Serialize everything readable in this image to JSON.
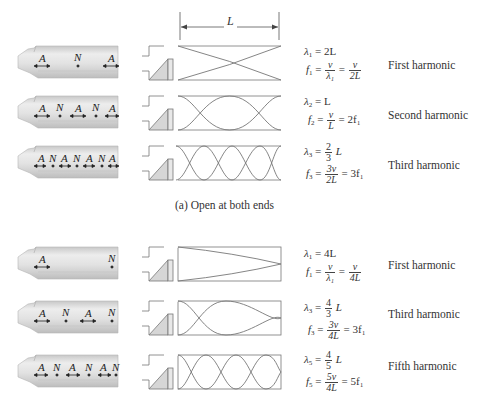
{
  "figure": {
    "length_label": "L",
    "caption_a": "(a) Open at both ends",
    "colors": {
      "line": "#7a7a7a",
      "pipe_fill": "#d9d9d9",
      "pipe_highlight": "#f2f2f2",
      "mouthpiece_fill": "#d6d6d6",
      "text": "#333333"
    }
  },
  "open_both_ends": [
    {
      "harmonic_label": "First harmonic",
      "pipe_markers": [
        "A",
        "N",
        "A"
      ],
      "wavelength": {
        "lhs": "λ",
        "sub": "1",
        "rhs": "= 2L"
      },
      "frequency": {
        "lhs": "f",
        "sub": "1",
        "eq1": "=",
        "frac1_num": "v",
        "frac1_den": "λ₁",
        "eq2": "=",
        "frac2_num": "v",
        "frac2_den": "2L",
        "tail": ""
      }
    },
    {
      "harmonic_label": "Second harmonic",
      "pipe_markers": [
        "A",
        "N",
        "A",
        "N",
        "A"
      ],
      "wavelength": {
        "lhs": "λ",
        "sub": "2",
        "rhs": "= L"
      },
      "frequency": {
        "lhs": "f",
        "sub": "2",
        "eq1": "=",
        "frac1_num": "v",
        "frac1_den": "L",
        "eq2": "",
        "frac2_num": "",
        "frac2_den": "",
        "tail": "= 2f₁"
      }
    },
    {
      "harmonic_label": "Third harmonic",
      "pipe_markers": [
        "A",
        "N",
        "A",
        "N",
        "A",
        "N",
        "A"
      ],
      "wavelength": {
        "lhs": "λ",
        "sub": "3",
        "rhs_pre": "=",
        "frac_num": "2",
        "frac_den": "3",
        "rhs_post": "L"
      },
      "frequency": {
        "lhs": "f",
        "sub": "3",
        "eq1": "=",
        "frac1_num": "3v",
        "frac1_den": "2L",
        "eq2": "",
        "frac2_num": "",
        "frac2_den": "",
        "tail": "= 3f₁"
      }
    }
  ],
  "closed_one_end": [
    {
      "harmonic_label": "First harmonic",
      "pipe_markers": [
        "A",
        "N"
      ],
      "wavelength": {
        "lhs": "λ",
        "sub": "1",
        "rhs": "= 4L"
      },
      "frequency": {
        "lhs": "f",
        "sub": "1",
        "eq1": "=",
        "frac1_num": "v",
        "frac1_den": "λ₁",
        "eq2": "=",
        "frac2_num": "v",
        "frac2_den": "4L",
        "tail": ""
      }
    },
    {
      "harmonic_label": "Third harmonic",
      "pipe_markers": [
        "A",
        "N",
        "A",
        "N"
      ],
      "wavelength": {
        "lhs": "λ",
        "sub": "3",
        "rhs_pre": "=",
        "frac_num": "4",
        "frac_den": "3",
        "rhs_post": "L"
      },
      "frequency": {
        "lhs": "f",
        "sub": "3",
        "eq1": "=",
        "frac1_num": "3v",
        "frac1_den": "4L",
        "eq2": "",
        "frac2_num": "",
        "frac2_den": "",
        "tail": "= 3f₁"
      }
    },
    {
      "harmonic_label": "Fifth harmonic",
      "pipe_markers": [
        "A",
        "N",
        "A",
        "N",
        "A",
        "N"
      ],
      "wavelength": {
        "lhs": "λ",
        "sub": "5",
        "rhs_pre": "=",
        "frac_num": "4",
        "frac_den": "5",
        "rhs_post": "L"
      },
      "frequency": {
        "lhs": "f",
        "sub": "5",
        "eq1": "=",
        "frac1_num": "5v",
        "frac1_den": "4L",
        "eq2": "",
        "frac2_num": "",
        "frac2_den": "",
        "tail": "= 5f₁"
      }
    }
  ]
}
